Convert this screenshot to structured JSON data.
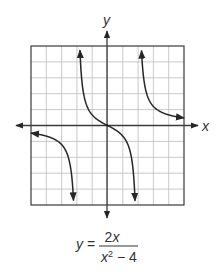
{
  "chart_data": {
    "type": "line",
    "title": "",
    "xlabel": "x",
    "ylabel": "y",
    "xlim": [
      -5,
      5
    ],
    "ylim": [
      -5,
      5
    ],
    "grid": true,
    "grid_step": 1,
    "equation": {
      "lhs": "y =",
      "numerator": "2x",
      "denominator_base": "x",
      "denominator_exp": "2",
      "denominator_rest": " − 4",
      "text": "y = 2x / (x² − 4)"
    },
    "vertical_asymptotes": [
      -2,
      2
    ],
    "horizontal_asymptote": 0,
    "series": [
      {
        "name": "left branch",
        "x": [
          -5,
          -4.5,
          -4,
          -3.5,
          -3,
          -2.6,
          -2.4,
          -2.3,
          -2.2
        ],
        "y": [
          -0.48,
          -0.55,
          -0.67,
          -0.85,
          -1.2,
          -1.89,
          -2.73,
          -3.54,
          -5.24
        ]
      },
      {
        "name": "middle branch",
        "x": [
          -1.8,
          -1.7,
          -1.5,
          -1.2,
          -0.8,
          -0.4,
          0,
          0.4,
          0.8,
          1.2,
          1.5,
          1.7,
          1.8
        ],
        "y": [
          4.74,
          3.06,
          1.71,
          0.94,
          0.48,
          0.21,
          0,
          -0.21,
          -0.48,
          -0.94,
          -1.71,
          -3.06,
          -4.74
        ]
      },
      {
        "name": "right branch",
        "x": [
          2.2,
          2.3,
          2.4,
          2.6,
          3,
          3.5,
          4,
          4.5,
          5
        ],
        "y": [
          5.24,
          3.54,
          2.73,
          1.89,
          1.2,
          0.85,
          0.67,
          0.55,
          0.48
        ]
      }
    ],
    "colors": {
      "grid": "#bdbdbd",
      "axes": "#3a3a3a",
      "curve": "#262626",
      "text": "#333333"
    }
  },
  "labels": {
    "x_axis": "x",
    "y_axis": "y"
  }
}
